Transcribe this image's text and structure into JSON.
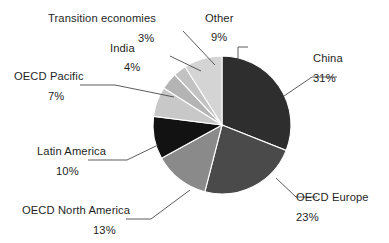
{
  "chart_data": {
    "type": "pie",
    "title": "",
    "subtitle": "",
    "xlabel": "",
    "ylabel": "",
    "legend_position": "callout-labels",
    "grid": false,
    "units": "percent",
    "start_angle_deg": 0,
    "direction": "clockwise",
    "categories": [
      "China",
      "OECD Europe",
      "OECD North America",
      "Latin America",
      "OECD Pacific",
      "India",
      "Transition economies",
      "Other"
    ],
    "values": [
      31,
      23,
      13,
      10,
      7,
      4,
      3,
      9
    ],
    "value_labels": [
      "31%",
      "23%",
      "13%",
      "10%",
      "7%",
      "4%",
      "3%",
      "9%"
    ],
    "colors": [
      "#2e2e2e",
      "#4a4a4a",
      "#8a8a8a",
      "#121212",
      "#c8c8c8",
      "#b4b4b4",
      "#c2c2c2",
      "#d4d4d4"
    ],
    "slices": [
      {
        "name": "China",
        "value": 31,
        "value_label": "31%",
        "color": "#2e2e2e"
      },
      {
        "name": "OECD Europe",
        "value": 23,
        "value_label": "23%",
        "color": "#4a4a4a"
      },
      {
        "name": "OECD North America",
        "value": 13,
        "value_label": "13%",
        "color": "#8a8a8a"
      },
      {
        "name": "Latin America",
        "value": 10,
        "value_label": "10%",
        "color": "#121212"
      },
      {
        "name": "OECD Pacific",
        "value": 7,
        "value_label": "7%",
        "color": "#c8c8c8"
      },
      {
        "name": "India",
        "value": 4,
        "value_label": "4%",
        "color": "#b4b4b4"
      },
      {
        "name": "Transition economies",
        "value": 3,
        "value_label": "3%",
        "color": "#c2c2c2"
      },
      {
        "name": "Other",
        "value": 9,
        "value_label": "9%",
        "color": "#d4d4d4"
      }
    ]
  },
  "labels": {
    "china": {
      "name": "China",
      "value": "31%"
    },
    "oecd_europe": {
      "name": "OECD Europe",
      "value": "23%"
    },
    "oecd_north_america": {
      "name": "OECD North America",
      "value": "13%"
    },
    "latin_america": {
      "name": "Latin America",
      "value": "10%"
    },
    "oecd_pacific": {
      "name": "OECD Pacific",
      "value": "7%"
    },
    "india": {
      "name": "India",
      "value": "4%"
    },
    "transition_economies": {
      "name": "Transition economies",
      "value": "3%"
    },
    "other": {
      "name": "Other",
      "value": "9%"
    }
  },
  "style": {
    "background": "#ffffff",
    "text_color": "#1f1f1f",
    "leader_color": "#4a4a4a",
    "slice_separator": "#ffffff"
  }
}
